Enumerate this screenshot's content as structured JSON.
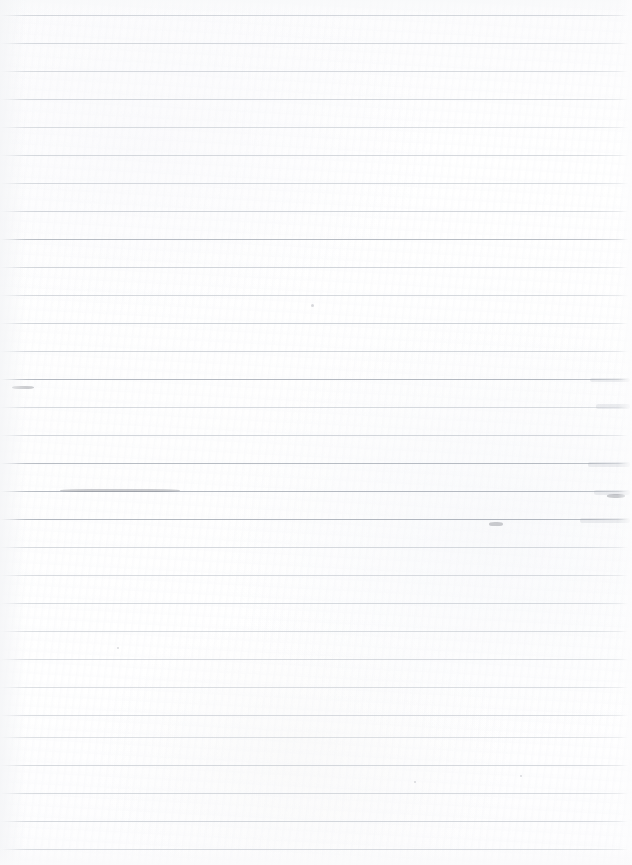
{
  "document": {
    "type": "scanned-lined-paper",
    "title": "Blank Ruled Notebook Page",
    "description": "A scanned blank sheet of wide-ruled notebook paper with no handwriting or printed text.",
    "width_px": 632,
    "height_px": 865,
    "orientation": "portrait",
    "text_content": "",
    "has_handwriting": false,
    "has_margin_rule": false
  },
  "paper": {
    "background_color": "#fdfdfd",
    "base_tone": "#ffffff",
    "tint": "cool-neutral-gray"
  },
  "ruling": {
    "line_color": "#b9bfc7",
    "line_color_dark": "#9aa1ab",
    "line_thickness_px": 1,
    "line_spacing_px": 28,
    "first_line_y_px": 15,
    "line_count": 31,
    "left_inset_px": 0,
    "right_extent_px": 628,
    "lines": [
      {
        "y": 15,
        "opacity": 0.62
      },
      {
        "y": 43,
        "opacity": 0.58
      },
      {
        "y": 71,
        "opacity": 0.55
      },
      {
        "y": 99,
        "opacity": 0.6
      },
      {
        "y": 127,
        "opacity": 0.52
      },
      {
        "y": 155,
        "opacity": 0.58
      },
      {
        "y": 183,
        "opacity": 0.56
      },
      {
        "y": 211,
        "opacity": 0.62
      },
      {
        "y": 239,
        "opacity": 0.7
      },
      {
        "y": 267,
        "opacity": 0.64
      },
      {
        "y": 295,
        "opacity": 0.58
      },
      {
        "y": 323,
        "opacity": 0.66
      },
      {
        "y": 351,
        "opacity": 0.6
      },
      {
        "y": 379,
        "opacity": 0.74
      },
      {
        "y": 407,
        "opacity": 0.56
      },
      {
        "y": 435,
        "opacity": 0.62
      },
      {
        "y": 463,
        "opacity": 0.7
      },
      {
        "y": 491,
        "opacity": 0.72
      },
      {
        "y": 519,
        "opacity": 0.76
      },
      {
        "y": 547,
        "opacity": 0.58
      },
      {
        "y": 575,
        "opacity": 0.54
      },
      {
        "y": 603,
        "opacity": 0.56
      },
      {
        "y": 631,
        "opacity": 0.52
      },
      {
        "y": 659,
        "opacity": 0.55
      },
      {
        "y": 687,
        "opacity": 0.5
      },
      {
        "y": 715,
        "opacity": 0.54
      },
      {
        "y": 737,
        "opacity": 0.48
      },
      {
        "y": 765,
        "opacity": 0.58
      },
      {
        "y": 793,
        "opacity": 0.56
      },
      {
        "y": 821,
        "opacity": 0.6
      },
      {
        "y": 849,
        "opacity": 0.62
      }
    ]
  },
  "artifacts": {
    "edge_fade_left_px": 26,
    "edge_fade_right_px": 14,
    "ink_bands": [
      {
        "x": 590,
        "y": 378,
        "w": 40,
        "h": 4
      },
      {
        "x": 596,
        "y": 404,
        "w": 34,
        "h": 5
      },
      {
        "x": 588,
        "y": 462,
        "w": 42,
        "h": 5
      },
      {
        "x": 594,
        "y": 490,
        "w": 36,
        "h": 5
      },
      {
        "x": 580,
        "y": 518,
        "w": 50,
        "h": 5
      }
    ],
    "specks": [
      {
        "x": 311,
        "y": 304,
        "d": 3
      },
      {
        "x": 520,
        "y": 775,
        "d": 2
      },
      {
        "x": 414,
        "y": 781,
        "d": 2
      },
      {
        "x": 117,
        "y": 647,
        "d": 2
      }
    ],
    "smudges": [
      {
        "x": 489,
        "y": 522,
        "w": 14,
        "h": 4
      },
      {
        "x": 12,
        "y": 386,
        "w": 22,
        "h": 3
      },
      {
        "x": 607,
        "y": 494,
        "w": 18,
        "h": 4
      },
      {
        "x": 60,
        "y": 489,
        "w": 120,
        "h": 3
      }
    ]
  }
}
